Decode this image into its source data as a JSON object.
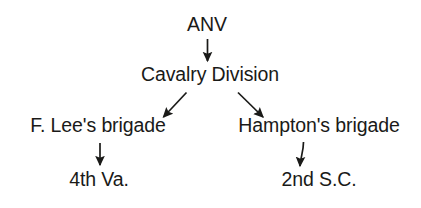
{
  "diagram": {
    "type": "tree",
    "background_color": "#ffffff",
    "ink_color": "#1a1a18",
    "nodes": {
      "root": "ANV",
      "division": "Cavalry Division",
      "brigade_left": "F. Lee's brigade",
      "brigade_right": "Hampton's brigade",
      "regiment_left": "4th Va.",
      "regiment_right": "2nd S.C."
    },
    "edges": [
      {
        "name": "root-to-division",
        "from": "ANV",
        "to": "Cavalry Division",
        "style": "straight-vertical"
      },
      {
        "name": "division-to-brigade-left",
        "from": "Cavalry Division",
        "to": "F. Lee's brigade",
        "style": "diagonal-down-left"
      },
      {
        "name": "division-to-brigade-right",
        "from": "Cavalry Division",
        "to": "Hampton's brigade",
        "style": "diagonal-down-right"
      },
      {
        "name": "brigade-left-to-regiment",
        "from": "F. Lee's brigade",
        "to": "4th Va.",
        "style": "straight-vertical"
      },
      {
        "name": "brigade-right-to-regiment",
        "from": "Hampton's brigade",
        "to": "2nd S.C.",
        "style": "curved-vertical"
      }
    ]
  }
}
